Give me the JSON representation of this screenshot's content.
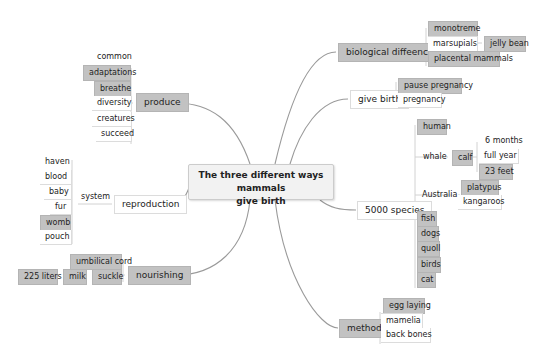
{
  "center": {
    "line1": "The three different   ways mammals",
    "line2": "give birth"
  },
  "produce": {
    "label": "produce",
    "children": [
      "common",
      "adaptations",
      "breathe",
      "diversity",
      "creatures",
      "succeed"
    ]
  },
  "reproduction": {
    "label": "reproduction",
    "system": "system",
    "children": [
      "haven",
      "blood",
      "baby",
      "fur",
      "womb",
      "pouch"
    ]
  },
  "nourishing": {
    "label": "nourishing",
    "umbilical": "umbilical cord",
    "suckle": "suckle",
    "milk": "milk",
    "liters": "225 liters"
  },
  "biological": {
    "label": "biological diffeenc es",
    "monotreme": "monotreme",
    "marsupials": "marsupials",
    "jelly": "jelly bean",
    "placental": "placental mammals"
  },
  "give_birth": {
    "label": "give birth",
    "pause": "pause pregnancy",
    "pregnancy": "pregnancy"
  },
  "species": {
    "label": "5000 species",
    "human": "human",
    "whale": "whale",
    "calf": "calf",
    "calf_children": [
      "6 months",
      "full year",
      "23 feet"
    ],
    "australia": "Australia",
    "australia_children": [
      "platypus",
      "kangaroos"
    ],
    "animals": [
      "fish",
      "dogs",
      "quoll",
      "birds",
      "cat"
    ]
  },
  "method": {
    "label": "method",
    "children": [
      "egg laying",
      "mamelia",
      "back bones"
    ]
  }
}
